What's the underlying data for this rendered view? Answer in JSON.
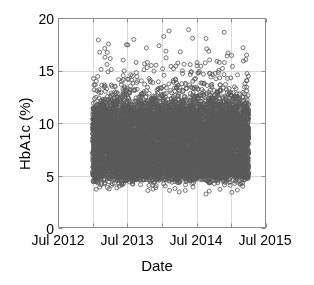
{
  "chart_data": {
    "type": "scatter",
    "title": "",
    "xlabel": "Date",
    "ylabel": "HbA1c (%)",
    "xlim": [
      "Jul 2012",
      "Jul 2015"
    ],
    "ylim": [
      0,
      20
    ],
    "yticks": [
      0,
      5,
      10,
      15,
      20
    ],
    "ytick_labels": [
      "0",
      "5",
      "10",
      "15",
      "20"
    ],
    "xticks": [
      "Jul 2012",
      "Jul 2013",
      "Jul 2014",
      "Jul 2015"
    ],
    "xtick_labels": [
      "Jul 2012",
      "Jul 2013",
      "Jul 2014",
      "Jul 2015"
    ],
    "xtick_minor_interval_years": 0.5,
    "grid": true,
    "grid_color": "#d9d9d9",
    "axis_color": "#8c8c8c",
    "marker": "open-circle",
    "marker_size_px": 4,
    "marker_color": "#5a5a5a",
    "legend": null,
    "data_extent": {
      "x_start": "Jan 2013",
      "x_end": "Apr 2015",
      "y_min": 3.2,
      "y_max": 19.0,
      "dense_band_low": 4.6,
      "dense_band_high": 11.6
    },
    "series": [
      {
        "name": "HbA1c measurements",
        "approx_point_count": 9000,
        "description": "Dense near-uniform band of individual HbA1c readings spanning Jan 2013 to Apr 2015, concentrated between 5% and 11%, with a sparse upper tail of outliers up to 19% and a thin lower tail down to about 3.2%.",
        "density_profile": [
          {
            "y": 3.2,
            "relative_density": 0.01
          },
          {
            "y": 3.6,
            "relative_density": 0.02
          },
          {
            "y": 4.0,
            "relative_density": 0.05
          },
          {
            "y": 4.4,
            "relative_density": 0.15
          },
          {
            "y": 4.8,
            "relative_density": 0.55
          },
          {
            "y": 5.2,
            "relative_density": 0.95
          },
          {
            "y": 6.0,
            "relative_density": 1.0
          },
          {
            "y": 7.0,
            "relative_density": 1.0
          },
          {
            "y": 8.0,
            "relative_density": 1.0
          },
          {
            "y": 9.0,
            "relative_density": 1.0
          },
          {
            "y": 10.0,
            "relative_density": 0.98
          },
          {
            "y": 10.8,
            "relative_density": 0.9
          },
          {
            "y": 11.5,
            "relative_density": 0.6
          },
          {
            "y": 12.0,
            "relative_density": 0.35
          },
          {
            "y": 12.6,
            "relative_density": 0.18
          },
          {
            "y": 13.2,
            "relative_density": 0.1
          },
          {
            "y": 14.0,
            "relative_density": 0.05
          },
          {
            "y": 15.0,
            "relative_density": 0.025
          },
          {
            "y": 16.0,
            "relative_density": 0.014
          },
          {
            "y": 17.0,
            "relative_density": 0.008
          },
          {
            "y": 18.0,
            "relative_density": 0.005
          },
          {
            "y": 19.0,
            "relative_density": 0.002
          }
        ]
      }
    ]
  }
}
